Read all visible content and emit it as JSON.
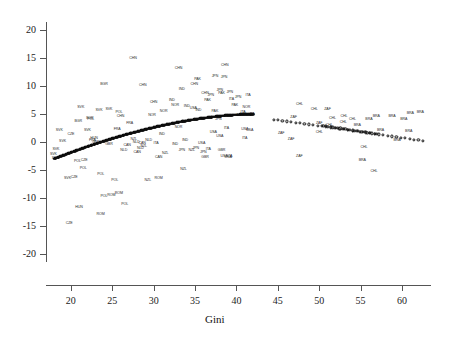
{
  "chart_data": {
    "type": "scatter",
    "title": "",
    "xlabel": "Gini",
    "ylabel": "",
    "xlim": [
      17.0,
      63.5
    ],
    "ylim": [
      -21.5,
      21.5
    ],
    "grid": false,
    "legend": null,
    "xticks": [
      20,
      25,
      30,
      35,
      40,
      45,
      50,
      55,
      60
    ],
    "yticks": [
      20,
      15,
      10,
      5,
      0,
      -5,
      -10,
      -15,
      -20
    ],
    "marker_style": "country-code-text-labels",
    "series": [
      {
        "name": "observations",
        "label_type": "iso3-country-code",
        "points": [
          {
            "label": "CHN",
            "x": 27.5,
            "y": 14.8
          },
          {
            "label": "CHN",
            "x": 33.0,
            "y": 13.0
          },
          {
            "label": "CHN",
            "x": 38.6,
            "y": 13.6
          },
          {
            "label": "CHN",
            "x": 34.9,
            "y": 10.3
          },
          {
            "label": "CHN",
            "x": 28.7,
            "y": 10.0
          },
          {
            "label": "CHN",
            "x": 36.2,
            "y": 8.6
          },
          {
            "label": "CHN",
            "x": 30.0,
            "y": 7.0
          },
          {
            "label": "CHN",
            "x": 26.0,
            "y": 4.5
          },
          {
            "label": "BGR",
            "x": 24.0,
            "y": 10.2
          },
          {
            "label": "BGR",
            "x": 22.3,
            "y": 4.1
          },
          {
            "label": "BGR",
            "x": 20.9,
            "y": 3.6
          },
          {
            "label": "IND",
            "x": 33.4,
            "y": 9.4
          },
          {
            "label": "IND",
            "x": 32.2,
            "y": 7.4
          },
          {
            "label": "IND",
            "x": 34.0,
            "y": 6.3
          },
          {
            "label": "IND",
            "x": 35.4,
            "y": 5.6
          },
          {
            "label": "IND",
            "x": 31.0,
            "y": 1.3
          },
          {
            "label": "IND",
            "x": 33.8,
            "y": 0.2
          },
          {
            "label": "IND",
            "x": 32.6,
            "y": -0.5
          },
          {
            "label": "PAK",
            "x": 35.3,
            "y": 11.1
          },
          {
            "label": "PAK",
            "x": 38.2,
            "y": 8.6
          },
          {
            "label": "PAK",
            "x": 36.5,
            "y": 7.4
          },
          {
            "label": "PAK",
            "x": 39.8,
            "y": 6.5
          },
          {
            "label": "PAK",
            "x": 37.4,
            "y": 5.4
          },
          {
            "label": "PAK",
            "x": 40.4,
            "y": 4.6
          },
          {
            "label": "JPN",
            "x": 37.4,
            "y": 11.7
          },
          {
            "label": "JPN",
            "x": 38.5,
            "y": 11.4
          },
          {
            "label": "JPN",
            "x": 38.0,
            "y": 9.1
          },
          {
            "label": "JPN",
            "x": 39.2,
            "y": 8.7
          },
          {
            "label": "JPN",
            "x": 36.9,
            "y": 8.2
          },
          {
            "label": "JPN",
            "x": 40.2,
            "y": 7.8
          },
          {
            "label": "JPN",
            "x": 37.8,
            "y": 4.0
          },
          {
            "label": "JPN",
            "x": 35.1,
            "y": -1.2
          },
          {
            "label": "JPN",
            "x": 33.4,
            "y": -1.6
          },
          {
            "label": "JPN",
            "x": 36.0,
            "y": -1.9
          },
          {
            "label": "ITA",
            "x": 41.4,
            "y": 8.3
          },
          {
            "label": "ITA",
            "x": 39.4,
            "y": 7.6
          },
          {
            "label": "ITA",
            "x": 40.8,
            "y": 5.2
          },
          {
            "label": "ITA",
            "x": 41.9,
            "y": 4.8
          },
          {
            "label": "ITA",
            "x": 38.8,
            "y": 2.4
          },
          {
            "label": "ITA",
            "x": 41.0,
            "y": 0.6
          },
          {
            "label": "ITA",
            "x": 30.3,
            "y": -0.4
          },
          {
            "label": "ITA",
            "x": 36.6,
            "y": -1.4
          },
          {
            "label": "ITA",
            "x": 39.2,
            "y": -2.6
          },
          {
            "label": "NOR",
            "x": 41.2,
            "y": 6.1
          },
          {
            "label": "NOR",
            "x": 32.6,
            "y": 6.4
          },
          {
            "label": "NOR",
            "x": 31.2,
            "y": 5.3
          },
          {
            "label": "NOR",
            "x": 29.8,
            "y": 4.7
          },
          {
            "label": "NOR",
            "x": 33.0,
            "y": 2.5
          },
          {
            "label": "USA",
            "x": 34.8,
            "y": 6.0
          },
          {
            "label": "USA",
            "x": 41.0,
            "y": 2.2
          },
          {
            "label": "USA",
            "x": 41.6,
            "y": 1.9
          },
          {
            "label": "USA",
            "x": 37.2,
            "y": 1.7
          },
          {
            "label": "USA",
            "x": 38.0,
            "y": 0.9
          },
          {
            "label": "USA",
            "x": 35.8,
            "y": -0.3
          },
          {
            "label": "USA",
            "x": 38.5,
            "y": -2.7
          },
          {
            "label": "USA",
            "x": 39.0,
            "y": -2.9
          },
          {
            "label": "SVK",
            "x": 21.2,
            "y": 6.1
          },
          {
            "label": "SVK",
            "x": 23.4,
            "y": 5.6
          },
          {
            "label": "SVK",
            "x": 18.6,
            "y": 2.0
          },
          {
            "label": "SVK",
            "x": 18.2,
            "y": -1.4
          },
          {
            "label": "SVK",
            "x": 19.0,
            "y": 0.0
          },
          {
            "label": "SVK",
            "x": 17.9,
            "y": -2.4
          },
          {
            "label": "SVK",
            "x": 19.6,
            "y": -6.6
          },
          {
            "label": "SVK",
            "x": 22.0,
            "y": 1.9
          },
          {
            "label": "SVK",
            "x": 24.6,
            "y": 5.7
          },
          {
            "label": "SVK",
            "x": 18.1,
            "y": -3.0
          },
          {
            "label": "POL",
            "x": 25.8,
            "y": 5.2
          },
          {
            "label": "POL",
            "x": 20.8,
            "y": -3.6
          },
          {
            "label": "POL",
            "x": 21.5,
            "y": -4.8
          },
          {
            "label": "POL",
            "x": 25.3,
            "y": -7.0
          },
          {
            "label": "POL",
            "x": 24.0,
            "y": -9.8
          },
          {
            "label": "POL",
            "x": 26.5,
            "y": -11.3
          },
          {
            "label": "POL",
            "x": 23.6,
            "y": -5.9
          },
          {
            "label": "POL",
            "x": 22.4,
            "y": 3.9
          },
          {
            "label": "CZE",
            "x": 20.4,
            "y": -6.5
          },
          {
            "label": "CZE",
            "x": 19.8,
            "y": -14.7
          },
          {
            "label": "CZE",
            "x": 20.0,
            "y": 1.3
          },
          {
            "label": "CZE",
            "x": 21.6,
            "y": -3.4
          },
          {
            "label": "HUN",
            "x": 21.0,
            "y": -11.8
          },
          {
            "label": "HUN",
            "x": 22.8,
            "y": 0.6
          },
          {
            "label": "ROM",
            "x": 25.8,
            "y": -9.4
          },
          {
            "label": "ROM",
            "x": 23.6,
            "y": -13.0
          },
          {
            "label": "ROM",
            "x": 30.6,
            "y": -6.7
          },
          {
            "label": "ROM",
            "x": 24.9,
            "y": -9.6
          },
          {
            "label": "NZL",
            "x": 28.8,
            "y": -0.9
          },
          {
            "label": "NZL",
            "x": 31.4,
            "y": -2.2
          },
          {
            "label": "NZL",
            "x": 33.6,
            "y": -5.0
          },
          {
            "label": "NZL",
            "x": 29.3,
            "y": -7.0
          },
          {
            "label": "NZL",
            "x": 34.6,
            "y": -1.6
          },
          {
            "label": "NZL",
            "x": 27.6,
            "y": 0.4
          },
          {
            "label": "NLD",
            "x": 27.9,
            "y": -0.1
          },
          {
            "label": "NLD",
            "x": 29.4,
            "y": 0.2
          },
          {
            "label": "NLD",
            "x": 28.4,
            "y": -1.2
          },
          {
            "label": "NLD",
            "x": 26.4,
            "y": -1.6
          },
          {
            "label": "CAN",
            "x": 28.6,
            "y": -0.4
          },
          {
            "label": "CAN",
            "x": 28.0,
            "y": -1.9
          },
          {
            "label": "CAN",
            "x": 30.6,
            "y": -2.8
          },
          {
            "label": "CAN",
            "x": 26.8,
            "y": -0.8
          },
          {
            "label": "GBR",
            "x": 24.6,
            "y": -0.6
          },
          {
            "label": "GBR",
            "x": 23.0,
            "y": -0.2
          },
          {
            "label": "GBR",
            "x": 38.2,
            "y": -1.6
          },
          {
            "label": "GBR",
            "x": 36.2,
            "y": -2.8
          },
          {
            "label": "FRA",
            "x": 22.6,
            "y": 0.1
          },
          {
            "label": "FRA",
            "x": 25.6,
            "y": 2.1
          },
          {
            "label": "FRA",
            "x": 27.1,
            "y": 3.2
          },
          {
            "label": "CHL",
            "x": 47.6,
            "y": 6.7
          },
          {
            "label": "CHL",
            "x": 49.4,
            "y": 5.8
          },
          {
            "label": "CHL",
            "x": 51.6,
            "y": 4.2
          },
          {
            "label": "CHL",
            "x": 54.0,
            "y": 4.0
          },
          {
            "label": "CHL",
            "x": 52.9,
            "y": 3.4
          },
          {
            "label": "CHL",
            "x": 51.2,
            "y": 2.8
          },
          {
            "label": "CHL",
            "x": 50.0,
            "y": 1.6
          },
          {
            "label": "CHL",
            "x": 55.4,
            "y": -1.0
          },
          {
            "label": "CHL",
            "x": 56.6,
            "y": -5.4
          },
          {
            "label": "CHL",
            "x": 53.0,
            "y": 4.4
          },
          {
            "label": "ZAF",
            "x": 51.0,
            "y": 5.7
          },
          {
            "label": "ZAF",
            "x": 46.9,
            "y": 4.3
          },
          {
            "label": "ZAF",
            "x": 50.0,
            "y": 3.2
          },
          {
            "label": "ZAF",
            "x": 45.4,
            "y": 1.4
          },
          {
            "label": "ZAF",
            "x": 46.6,
            "y": 0.3
          },
          {
            "label": "ZAF",
            "x": 47.6,
            "y": -2.6
          },
          {
            "label": "BRA",
            "x": 56.9,
            "y": 4.4
          },
          {
            "label": "BRA",
            "x": 58.8,
            "y": 4.4
          },
          {
            "label": "BRA",
            "x": 56.0,
            "y": 4.0
          },
          {
            "label": "BRA",
            "x": 60.2,
            "y": 4.0
          },
          {
            "label": "BRA",
            "x": 54.6,
            "y": 2.9
          },
          {
            "label": "BRA",
            "x": 57.4,
            "y": 2.0
          },
          {
            "label": "BRA",
            "x": 60.8,
            "y": 1.8
          },
          {
            "label": "BRA",
            "x": 59.4,
            "y": 0.2
          },
          {
            "label": "BRA",
            "x": 62.2,
            "y": 5.2
          },
          {
            "label": "BRA",
            "x": 61.0,
            "y": 5.0
          },
          {
            "label": "BRA",
            "x": 55.2,
            "y": -3.4
          }
        ]
      },
      {
        "name": "fitted-curve-left",
        "marker": "filled-dot",
        "x_range": [
          18.0,
          42.0
        ],
        "y_range": [
          -3.0,
          5.0
        ],
        "description": "ascending concave fit through low-Gini cluster"
      },
      {
        "name": "fitted-curve-right",
        "marker": "open-circle",
        "x_range": [
          44.5,
          62.5
        ],
        "y_range": [
          4.0,
          0.2
        ],
        "description": "descending fit through high-Gini cluster"
      }
    ]
  },
  "axes": {
    "x_title": "Gini",
    "x_ticklabels": [
      "20",
      "25",
      "30",
      "35",
      "40",
      "45",
      "50",
      "55",
      "60"
    ],
    "y_ticklabels": [
      "20",
      "15",
      "10",
      "5",
      "0",
      "-5",
      "-10",
      "-15",
      "-20"
    ]
  },
  "colors": {
    "axis": "#555555",
    "label_text": "#2a2a2a",
    "marker": "#0d0d0d",
    "background": "#ffffff"
  }
}
